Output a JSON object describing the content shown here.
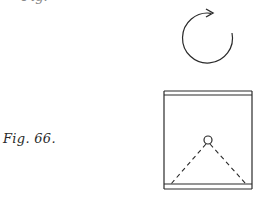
{
  "figure": {
    "label": "Fig. 66.",
    "cut_off_label": "Fig.",
    "rotation_arrow": {
      "icon": "clockwise-rotation-arrow-icon",
      "direction": "clockwise",
      "center": [
        207,
        38
      ],
      "radius": 25
    },
    "box": {
      "left": 164,
      "right": 252,
      "top_lines_y": [
        91,
        95
      ],
      "bottom_lines_y": [
        184,
        189
      ]
    },
    "pivot": {
      "icon": "pivot-circle-icon",
      "center": [
        208,
        140
      ],
      "radius": 4
    },
    "dashed_lines": [
      {
        "from": [
          208,
          144
        ],
        "to": [
          171,
          184
        ]
      },
      {
        "from": [
          208,
          144
        ],
        "to": [
          246,
          184
        ]
      }
    ],
    "colors": {
      "ink": "#2a2a2a",
      "background": "#ffffff"
    }
  }
}
